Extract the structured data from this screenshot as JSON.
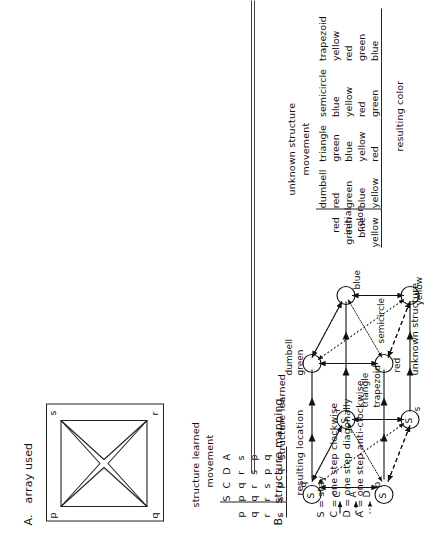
{
  "figure": {
    "panel_a": {
      "letter": "A.",
      "title": "array used",
      "array": {
        "corners": {
          "p": "p",
          "q": "q",
          "r": "r",
          "s": "s"
        },
        "shape_description": "square frame containing four inward-pointing triangles forming a cross"
      },
      "table": {
        "title": "structure learned",
        "subtitle": "movement",
        "footer": "resulting location",
        "columns": [
          "S",
          "C",
          "D",
          "A"
        ],
        "row_headers": [
          "p",
          "q",
          "r",
          "s"
        ],
        "rows": [
          [
            "p",
            "q",
            "r",
            "s"
          ],
          [
            "q",
            "r",
            "s",
            "p"
          ],
          [
            "r",
            "s",
            "p",
            "q"
          ],
          [
            "s",
            "p",
            "q",
            "r"
          ]
        ]
      },
      "legend": [
        "S = stay",
        "C = one step clockwise",
        "D = one step diagonally",
        "A = one step anti-clockwise"
      ]
    },
    "panel_b": {
      "letter": "B.",
      "title": "structure mapping",
      "cube": {
        "top_caption": "structure learned",
        "bottom_caption": "unknown structure",
        "top_face_nodes": [
          "p",
          "q",
          "r",
          "s"
        ],
        "bottom_face_nodes": [
          "red",
          "green",
          "blue",
          "yellow"
        ],
        "self_loop_label": "S",
        "movement_key": {
          "C": "C",
          "A": "A",
          "D": "D"
        },
        "bottom_edge_labels": [
          "triangle",
          "trapezoid",
          "semicircle"
        ]
      },
      "table": {
        "title": "unknown structure",
        "subtitle": "movement",
        "footer": "resulting color",
        "row_axis_label_line1": "initial",
        "row_axis_label_line2": "color",
        "columns": [
          "dumbell",
          "triangle",
          "semicircle",
          "trapezoid"
        ],
        "row_headers": [
          "red",
          "green",
          "blue",
          "yellow"
        ],
        "rows": [
          [
            "red",
            "green",
            "blue",
            "yellow"
          ],
          [
            "green",
            "blue",
            "yellow",
            "red"
          ],
          [
            "blue",
            "yellow",
            "red",
            "green"
          ],
          [
            "yellow",
            "red",
            "green",
            "blue"
          ]
        ]
      }
    },
    "colors": {
      "ink": "#111111",
      "line": "#222222",
      "page": "#ffffff"
    }
  }
}
